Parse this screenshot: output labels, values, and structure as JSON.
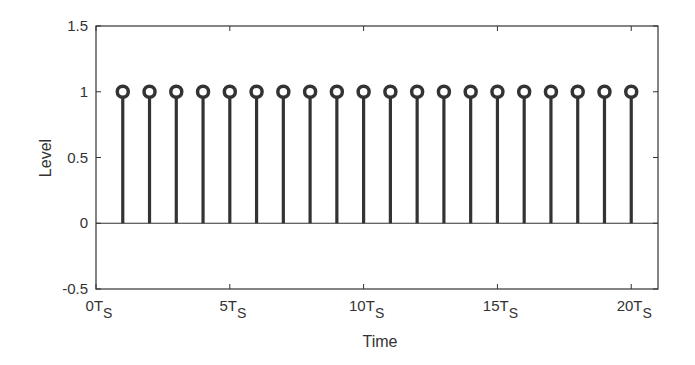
{
  "chart_data": {
    "type": "stem",
    "title": "",
    "xlabel": "Time",
    "ylabel": "Level",
    "xlim": [
      0,
      21
    ],
    "ylim": [
      -0.5,
      1.5
    ],
    "grid": false,
    "legend": null,
    "x": [
      1,
      2,
      3,
      4,
      5,
      6,
      7,
      8,
      9,
      10,
      11,
      12,
      13,
      14,
      15,
      16,
      17,
      18,
      19,
      20
    ],
    "values": [
      1,
      1,
      1,
      1,
      1,
      1,
      1,
      1,
      1,
      1,
      1,
      1,
      1,
      1,
      1,
      1,
      1,
      1,
      1,
      1
    ],
    "x_ticks": [
      {
        "value": 0,
        "label": "0T",
        "sub": "S"
      },
      {
        "value": 5,
        "label": "5T",
        "sub": "S"
      },
      {
        "value": 10,
        "label": "10T",
        "sub": "S"
      },
      {
        "value": 15,
        "label": "15T",
        "sub": "S"
      },
      {
        "value": 20,
        "label": "20T",
        "sub": "S"
      }
    ],
    "y_ticks": [
      {
        "value": -0.5,
        "label": "-0.5"
      },
      {
        "value": 0,
        "label": "0"
      },
      {
        "value": 0.5,
        "label": "0.5"
      },
      {
        "value": 1,
        "label": "1"
      },
      {
        "value": 1.5,
        "label": "1.5"
      }
    ],
    "baseline": 0,
    "colors": {
      "stem": "#333333",
      "axis": "#333333",
      "background": "#ffffff"
    }
  }
}
